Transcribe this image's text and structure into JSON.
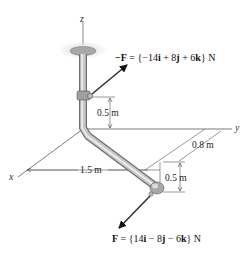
{
  "diagram": {
    "axes": {
      "x": "x",
      "y": "y",
      "z": "z"
    },
    "force_top": {
      "prefix": "−",
      "name": "F",
      "eq": " = {−14",
      "i": "i",
      "mid1": " + 8",
      "j": "j",
      "mid2": " + 6",
      "k": "k",
      "unit": "} N"
    },
    "force_bottom": {
      "name": "F",
      "eq": " = {14",
      "i": "i",
      "mid1": " − 8",
      "j": "j",
      "mid2": " − 6",
      "k": "k",
      "unit": "} N"
    },
    "dimensions": {
      "upper_vertical": "0.5 m",
      "horizontal_x": "1.5 m",
      "horizontal_y": "0.8 m",
      "lower_vertical": "0.5 m"
    },
    "colors": {
      "pipe": "#b8b8b8",
      "pipe_dark": "#7a7a7a",
      "support": "#9a9a9a",
      "arrow": "#111111"
    }
  }
}
